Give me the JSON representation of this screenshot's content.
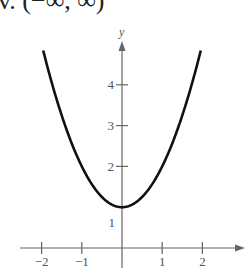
{
  "header": {
    "text": "v. (−∞, ∞)"
  },
  "chart_data": {
    "type": "line",
    "title": "",
    "function": "y = x^2 + 1",
    "xlabel": "",
    "ylabel": "y",
    "xlim": [
      -2.5,
      3
    ],
    "ylim": [
      0,
      5
    ],
    "x_ticks": [
      -2,
      -1,
      1,
      2
    ],
    "x_tick_labels": [
      "−2",
      "−1",
      "1",
      "2"
    ],
    "y_ticks": [
      1,
      2,
      3,
      4
    ],
    "y_tick_labels": [
      "1",
      "2",
      "3",
      "4"
    ],
    "grid": false,
    "series": [
      {
        "name": "f(x)",
        "x": [
          -2,
          -1.5,
          -1,
          -0.5,
          0,
          0.5,
          1,
          1.5,
          2
        ],
        "values": [
          5,
          3.25,
          2,
          1.25,
          1,
          1.25,
          2,
          3.25,
          5
        ]
      }
    ]
  }
}
